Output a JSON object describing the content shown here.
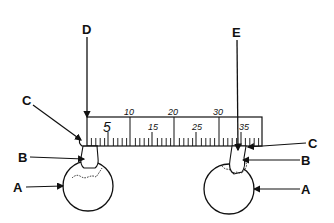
{
  "diagram": {
    "labels": {
      "D": "D",
      "E": "E",
      "C_left": "C",
      "C_right": "C",
      "B_left": "B",
      "B_right": "B",
      "A_left": "A",
      "A_right": "A"
    },
    "ruler": {
      "top_numbers": [
        "10",
        "20",
        "30"
      ],
      "middle_numbers": [
        "5",
        "15",
        "25",
        "35"
      ]
    }
  }
}
